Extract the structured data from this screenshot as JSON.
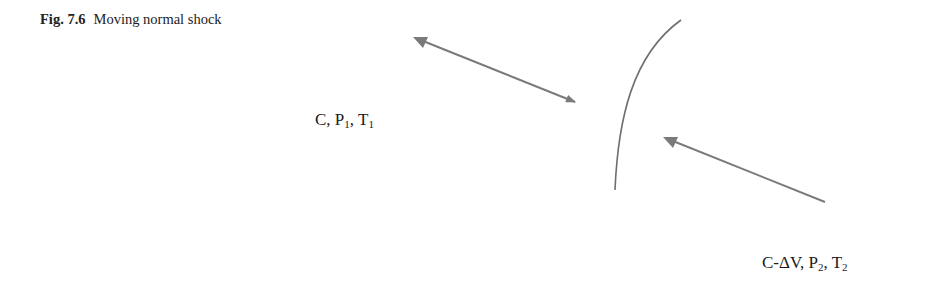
{
  "caption": {
    "figure_number": "Fig. 7.6",
    "title": "Moving normal shock"
  },
  "labels": {
    "upstream": {
      "velocity": "C",
      "p_symbol": "P",
      "p_sub": "1",
      "t_symbol": "T",
      "t_sub": "1"
    },
    "downstream": {
      "velocity": "C-ΔV",
      "p_symbol": "P",
      "p_sub": "2",
      "t_symbol": "T",
      "t_sub": "2"
    }
  },
  "colors": {
    "arrow": "#7a7a7a",
    "shock": "#6e6e6e"
  }
}
